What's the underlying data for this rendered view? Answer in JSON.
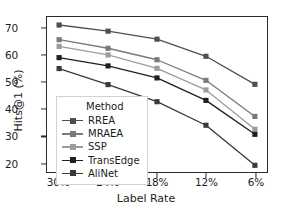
{
  "chart_data": {
    "type": "line",
    "title": "",
    "xlabel": "Label Rate",
    "ylabel": "Hits@1 (%)",
    "categories": [
      "30%",
      "24%",
      "18%",
      "12%",
      "6%"
    ],
    "xtick_labels": [
      "30%",
      "24%",
      "18%",
      "12%",
      "6%"
    ],
    "ytick_labels": [
      "20",
      "30",
      "40",
      "50",
      "60",
      "70"
    ],
    "ylim": [
      16.5,
      74.5
    ],
    "grid": false,
    "legend_position": "lower-left-inside",
    "legend_title": "Method",
    "marker": "square",
    "series": [
      {
        "name": "RREA",
        "color": "#4f4f4f",
        "values": [
          71.5,
          69.2,
          66.2,
          59.8,
          49.3
        ]
      },
      {
        "name": "MRAEA",
        "color": "#7a7a7a",
        "values": [
          66.0,
          62.8,
          58.5,
          50.8,
          37.3
        ]
      },
      {
        "name": "SSP",
        "color": "#9c9c9c",
        "values": [
          63.5,
          60.3,
          55.3,
          47.2,
          32.5
        ]
      },
      {
        "name": "TransEdge",
        "color": "#1f1f1f",
        "values": [
          59.3,
          56.2,
          51.7,
          43.3,
          30.6
        ]
      },
      {
        "name": "AliNet",
        "color": "#3a3a3a",
        "values": [
          55.2,
          49.2,
          42.8,
          34.0,
          19.0
        ]
      }
    ]
  },
  "figure": {
    "axis_color": "#2b2b2b",
    "background": "#ffffff"
  }
}
